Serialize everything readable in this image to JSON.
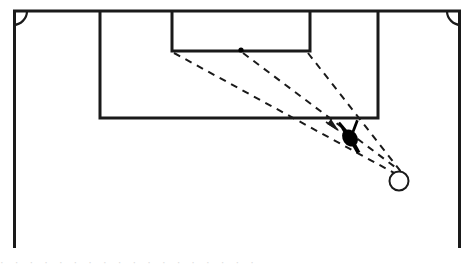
{
  "figure": {
    "type": "soccer-tactics-diagram",
    "background_color": "#ffffff",
    "line_color": "#1a1a1a",
    "marker_color": "#000000",
    "canvas": {
      "width": 474,
      "height": 269
    }
  },
  "pitch": {
    "goal_line": {
      "label": "goal line",
      "x1": 13,
      "y1": 11,
      "x2": 461,
      "y2": 11,
      "stroke_width": 3
    },
    "left_touchline": {
      "label": "left touchline",
      "x1": 13,
      "y1": 11,
      "x2": 13,
      "y2": 248,
      "stroke_width": 3
    },
    "right_touchline": {
      "label": "right touchline",
      "x1": 461,
      "y1": 11,
      "x2": 461,
      "y2": 248,
      "stroke_width": 3
    },
    "penalty_area": {
      "label": "penalty area",
      "x": 100,
      "y": 11,
      "width": 278,
      "height": 107,
      "stroke_width": 3
    },
    "goal_area": {
      "label": "goal area",
      "x": 172,
      "y": 11,
      "width": 138,
      "height": 40,
      "stroke_width": 3
    },
    "corner_arc_left": {
      "label": "left corner arc",
      "cx": 13,
      "cy": 11,
      "radius": 14
    },
    "corner_arc_right": {
      "label": "right corner arc",
      "cx": 461,
      "cy": 11,
      "radius": 14
    }
  },
  "markers": {
    "spot": {
      "label": "reference spot on goal area line",
      "cx": 241,
      "cy": 50,
      "radius": 2.6
    },
    "player": {
      "label": "attacking player",
      "cx": 350,
      "cy": 138,
      "rotation_deg": -35,
      "body_rx": 7.5,
      "body_ry": 9.5
    },
    "ball": {
      "label": "ball",
      "cx": 399,
      "cy": 181,
      "radius": 9.5,
      "stroke_width": 2,
      "fill": "#ffffff"
    }
  },
  "movement_lines": {
    "stroke_width": 2,
    "dash_pattern": "7 6",
    "paths": [
      {
        "name": "run-from-goal-area-left-corner",
        "description": "dashed run line from goal area left corner toward ball",
        "d": "M 174 53 L 396 174"
      },
      {
        "name": "run-from-spot",
        "description": "dashed run line from spot toward ball",
        "d": "M 243 53 L 399 170"
      },
      {
        "name": "run-from-goal-area-right-corner",
        "description": "dashed run line from goal area right corner toward ball",
        "d": "M 308 53 L 402 173"
      }
    ],
    "arrow": {
      "name": "cross-arrow",
      "description": "arrowhead pointing toward the attacking player",
      "tip_x": 338,
      "tip_y": 130,
      "rotation_deg": 47
    }
  },
  "caption": {
    "cropped_text_row": "· · ·  · ·   ·  ·  ·   ·  ·  ·  ·   · ·  · ·   · ·"
  }
}
